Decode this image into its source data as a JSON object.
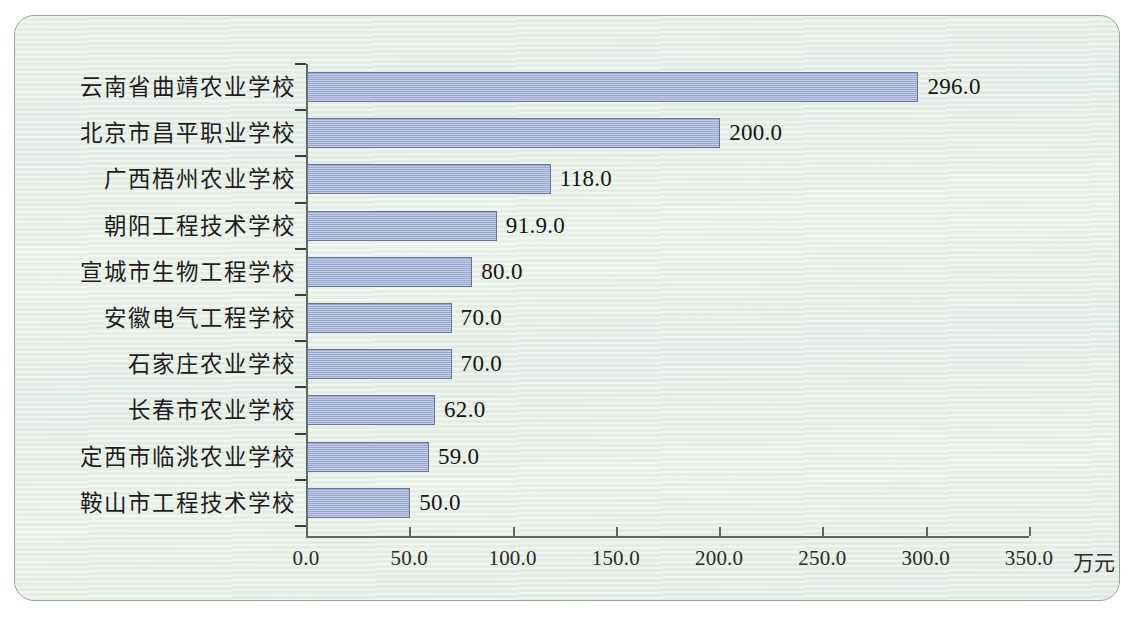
{
  "chart_data": {
    "type": "bar",
    "orientation": "horizontal",
    "title": "",
    "xlabel": "",
    "ylabel": "",
    "unit_label": "万元",
    "xlim": [
      0,
      350
    ],
    "xticks": [
      "0.0",
      "50.0",
      "100.0",
      "150.0",
      "200.0",
      "250.0",
      "300.0",
      "350.0"
    ],
    "xtick_values": [
      0,
      50,
      100,
      150,
      200,
      250,
      300,
      350
    ],
    "grid": false,
    "legend": null,
    "categories": [
      "云南省曲靖农业学校",
      "北京市昌平职业学校",
      "广西梧州农业学校",
      "朝阳工程技术学校",
      "宣城市生物工程学校",
      "安徽电气工程学校",
      "石家庄农业学校",
      "长春市农业学校",
      "定西市临洮农业学校",
      "鞍山市工程技术学校"
    ],
    "values": [
      296.0,
      200.0,
      118.0,
      91.9,
      80.0,
      70.0,
      70.0,
      62.0,
      59.0,
      50.0
    ],
    "value_labels": [
      "296.0",
      "200.0",
      "118.0",
      "91.9.0",
      "80.0",
      "70.0",
      "70.0",
      "62.0",
      "59.0",
      "50.0"
    ],
    "colors": {
      "bar_fill": "#9fb0d6",
      "bar_border": "#6a7794",
      "axis": "#5d6a63",
      "background": "#e8f0e8",
      "frame_border": "#9aa39c",
      "text": "#1d1d1d"
    }
  }
}
